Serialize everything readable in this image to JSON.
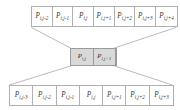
{
  "diagram": {
    "type": "butterfly-stencil-diagram",
    "background_color": "#ffffff",
    "line_color": "#8d8d8d",
    "cell_border_color": "#b0b0b0",
    "highlight_fill": "#d9d9d9",
    "text_color": "#3a3a3a",
    "top_row": {
      "name": "top-cell-row",
      "cells": [
        {
          "base": "P",
          "sub": "i,j-2"
        },
        {
          "base": "P",
          "sub": "i,j-1"
        },
        {
          "base": "P",
          "sub": "i,j"
        },
        {
          "base": "P",
          "sub": "i,j+1"
        },
        {
          "base": "P",
          "sub": "i,j+2"
        },
        {
          "base": "P",
          "sub": "i,j+3"
        },
        {
          "base": "P",
          "sub": "i,j+4"
        }
      ]
    },
    "middle_row": {
      "name": "middle-highlighted-row",
      "cells": [
        {
          "base": "P",
          "sub": "i,j"
        },
        {
          "base": "P",
          "sub": "i,j+1"
        }
      ]
    },
    "bottom_row": {
      "name": "bottom-cell-row",
      "cells": [
        {
          "base": "P",
          "sub": "i,j-3"
        },
        {
          "base": "P",
          "sub": "i,j-2"
        },
        {
          "base": "P",
          "sub": "i,j-1"
        },
        {
          "base": "P",
          "sub": "i,j"
        },
        {
          "base": "P",
          "sub": "i,j+1"
        },
        {
          "base": "P",
          "sub": "i,j+2"
        },
        {
          "base": "P",
          "sub": "i,j+3"
        }
      ]
    }
  }
}
